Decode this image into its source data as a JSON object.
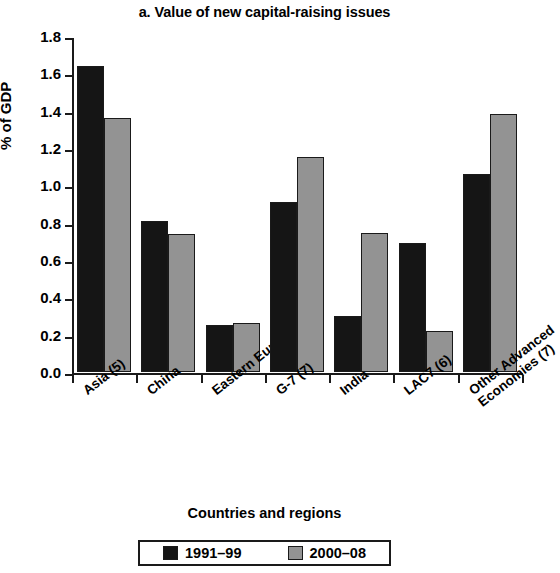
{
  "chart_data": {
    "type": "bar",
    "title": "a. Value of new capital-raising issues",
    "xlabel": "Countries and regions",
    "ylabel": "% of GDP",
    "ylim": [
      0.0,
      1.8
    ],
    "ytick_step": 0.2,
    "ytick_labels": [
      "1.8",
      "1.6",
      "1.4",
      "1.2",
      "1.0",
      "0.8",
      "0.6",
      "0.4",
      "0.2",
      "0.0"
    ],
    "ytick_values": [
      1.8,
      1.6,
      1.4,
      1.2,
      1.0,
      0.8,
      0.6,
      0.4,
      0.2,
      0.0
    ],
    "grid": false,
    "legend_position": "bottom",
    "categories": [
      "Asia (5)",
      "China",
      "Eastern Europe (7)",
      "G-7 (7)",
      "India",
      "LAC7 (6)",
      "Other Advanced Economies (7)"
    ],
    "category_lines": [
      [
        "Asia (5)"
      ],
      [
        "China"
      ],
      [
        "Eastern Europe (7)"
      ],
      [
        "G-7 (7)"
      ],
      [
        "India"
      ],
      [
        "LAC7 (6)"
      ],
      [
        "Other Advanced",
        "Economies (7)"
      ]
    ],
    "series": [
      {
        "name": "1991–99",
        "color": "#151515",
        "values": [
          1.64,
          0.81,
          0.25,
          0.91,
          0.3,
          0.69,
          1.06
        ]
      },
      {
        "name": "2000–08",
        "color": "#939393",
        "values": [
          1.36,
          0.74,
          0.26,
          1.15,
          0.745,
          0.22,
          1.38
        ]
      }
    ]
  },
  "legend": {
    "entries": [
      {
        "label": "1991–99",
        "swatch": "black-swatch"
      },
      {
        "label": "2000–08",
        "swatch": "gray-swatch"
      }
    ]
  }
}
